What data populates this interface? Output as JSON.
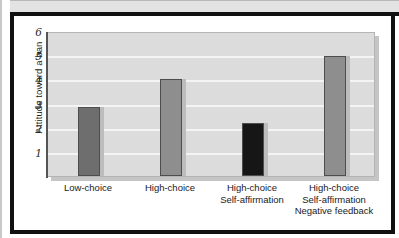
{
  "figure": {
    "frame_color": "#111111",
    "top_band_color": "#e3e3e3",
    "background_color": "#ffffff"
  },
  "chart_data": {
    "type": "bar",
    "title": "",
    "xlabel": "",
    "ylabel": "Attitude toward a ban",
    "categories": [
      "Low-choice",
      "High-choice",
      "High-choice\nSelf-affirmation",
      "High-choice\nSelf-affirmation\nNegative feedback"
    ],
    "values": [
      2.85,
      4.0,
      2.2,
      4.95
    ],
    "bar_colors": [
      "#6e6e6e",
      "#8e8e8e",
      "#161616",
      "#8e8e8e"
    ],
    "ylim": [
      0,
      6
    ],
    "yticks": [
      6,
      5,
      4,
      3,
      2,
      1
    ],
    "ytick_labels": [
      "6",
      "5",
      "4",
      "3",
      "2",
      "1"
    ],
    "grid": true,
    "grid_color": "#f4f4f4",
    "plot_background": "#dcdcdc",
    "legend": null
  }
}
